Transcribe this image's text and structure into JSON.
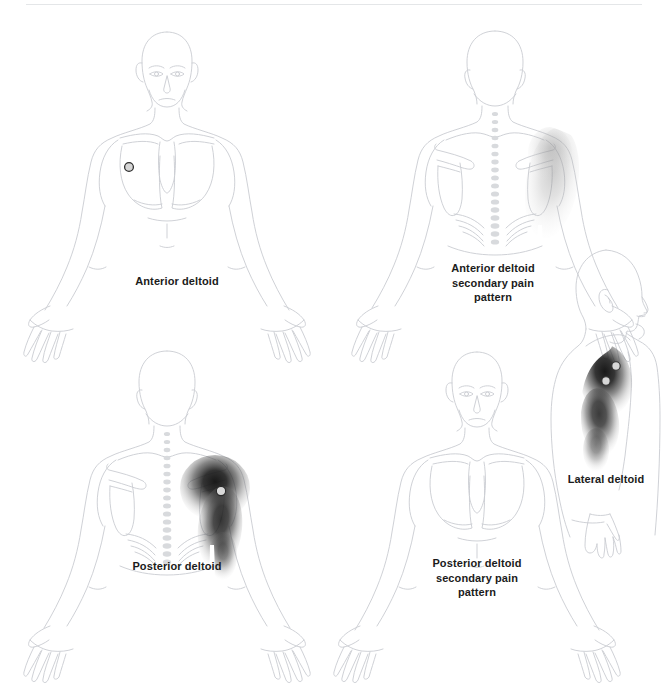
{
  "plate": {
    "title": "Deltoid trigger point referred pain patterns",
    "background_color": "#ffffff",
    "rule_color": "#e4e6e8",
    "outline_color": "#c9ccd1",
    "pain_color": "#1a1a1a",
    "caption_color": "#1b1b1b",
    "marker_fill": "#d6d6d6",
    "marker_stroke": "#3a3a3a"
  },
  "figures": [
    {
      "id": "anterior-deltoid",
      "caption": "Anterior deltoid",
      "view": "anterior",
      "muscle": "anterior deltoid",
      "pattern": "primary",
      "side": "left (viewer's left)",
      "intensity": "dark",
      "trigger_points": 1,
      "pain_region": "anterior shoulder and lateral upper arm"
    },
    {
      "id": "anterior-deltoid-secondary",
      "caption": "Anterior deltoid\nsecondary pain\npattern",
      "view": "posterior",
      "muscle": "anterior deltoid",
      "pattern": "secondary",
      "side": "left (viewer's right)",
      "intensity": "faint",
      "trigger_points": 0,
      "pain_region": "posterior shoulder and lateral upper arm"
    },
    {
      "id": "posterior-deltoid",
      "caption": "Posterior deltoid",
      "view": "posterior",
      "muscle": "posterior deltoid",
      "pattern": "primary",
      "side": "left (viewer's right)",
      "intensity": "dark",
      "trigger_points": 1,
      "pain_region": "posterior shoulder and posterior upper arm"
    },
    {
      "id": "posterior-deltoid-secondary",
      "caption": "Posterior deltoid\nsecondary pain\npattern",
      "view": "anterior",
      "muscle": "posterior deltoid",
      "pattern": "secondary",
      "side": "right (viewer's left)",
      "intensity": "faint",
      "trigger_points": 0,
      "pain_region": "anterior shoulder"
    },
    {
      "id": "lateral-deltoid",
      "caption": "Lateral deltoid",
      "view": "lateral",
      "muscle": "lateral deltoid",
      "pattern": "primary",
      "side": "left",
      "intensity": "dark",
      "trigger_points": 2,
      "pain_region": "lateral shoulder and lateral upper arm"
    }
  ]
}
